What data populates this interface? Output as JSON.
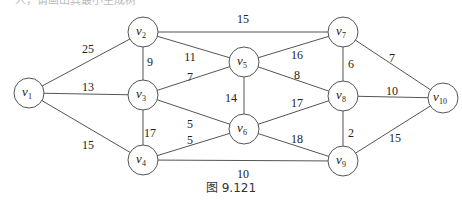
{
  "figure": {
    "caption": "图 9.121",
    "top_cut_text": "一人，请画出其最小生成树"
  },
  "graph": {
    "nodes": [
      {
        "id": "v1",
        "label": "v",
        "sub": "1",
        "x": 29,
        "y": 93
      },
      {
        "id": "v2",
        "label": "v",
        "sub": "2",
        "x": 143,
        "y": 32
      },
      {
        "id": "v3",
        "label": "v",
        "sub": "3",
        "x": 143,
        "y": 95
      },
      {
        "id": "v4",
        "label": "v",
        "sub": "4",
        "x": 143,
        "y": 160
      },
      {
        "id": "v5",
        "label": "v",
        "sub": "5",
        "x": 244,
        "y": 62
      },
      {
        "id": "v6",
        "label": "v",
        "sub": "6",
        "x": 244,
        "y": 129
      },
      {
        "id": "v7",
        "label": "v",
        "sub": "7",
        "x": 343,
        "y": 32
      },
      {
        "id": "v8",
        "label": "v",
        "sub": "8",
        "x": 343,
        "y": 96
      },
      {
        "id": "v9",
        "label": "v",
        "sub": "9",
        "x": 343,
        "y": 161
      },
      {
        "id": "v10",
        "label": "v",
        "sub": "10",
        "x": 443,
        "y": 98
      }
    ],
    "edges": [
      {
        "from": "v1",
        "to": "v2",
        "weight": "25",
        "lx": 88,
        "ly": 50
      },
      {
        "from": "v1",
        "to": "v3",
        "weight": "13",
        "lx": 88,
        "ly": 88
      },
      {
        "from": "v1",
        "to": "v4",
        "weight": "15",
        "lx": 88,
        "ly": 146
      },
      {
        "from": "v2",
        "to": "v3",
        "weight": "9",
        "lx": 150,
        "ly": 63
      },
      {
        "from": "v2",
        "to": "v5",
        "weight": "11",
        "lx": 190,
        "ly": 58
      },
      {
        "from": "v2",
        "to": "v7",
        "weight": "15",
        "lx": 243,
        "ly": 20
      },
      {
        "from": "v3",
        "to": "v5",
        "weight": "7",
        "lx": 190,
        "ly": 78
      },
      {
        "from": "v3",
        "to": "v4",
        "weight": "17",
        "lx": 150,
        "ly": 134
      },
      {
        "from": "v3",
        "to": "v6",
        "weight": "5",
        "lx": 190,
        "ly": 125
      },
      {
        "from": "v4",
        "to": "v6",
        "weight": "5",
        "lx": 190,
        "ly": 141
      },
      {
        "from": "v4",
        "to": "v9",
        "weight": "10",
        "lx": 243,
        "ly": 175
      },
      {
        "from": "v5",
        "to": "v6",
        "weight": "14",
        "lx": 231,
        "ly": 99
      },
      {
        "from": "v5",
        "to": "v7",
        "weight": "16",
        "lx": 297,
        "ly": 56
      },
      {
        "from": "v5",
        "to": "v8",
        "weight": "8",
        "lx": 297,
        "ly": 76
      },
      {
        "from": "v6",
        "to": "v8",
        "weight": "17",
        "lx": 297,
        "ly": 104
      },
      {
        "from": "v6",
        "to": "v9",
        "weight": "18",
        "lx": 297,
        "ly": 140
      },
      {
        "from": "v7",
        "to": "v8",
        "weight": "6",
        "lx": 351,
        "ly": 65
      },
      {
        "from": "v7",
        "to": "v10",
        "weight": "7",
        "lx": 392,
        "ly": 59
      },
      {
        "from": "v8",
        "to": "v10",
        "weight": "10",
        "lx": 392,
        "ly": 92
      },
      {
        "from": "v8",
        "to": "v9",
        "weight": "2",
        "lx": 351,
        "ly": 134
      },
      {
        "from": "v9",
        "to": "v10",
        "weight": "15",
        "lx": 395,
        "ly": 139
      }
    ]
  },
  "style": {
    "node_radius": 15,
    "line_color": "#555555",
    "text_color": "#222222"
  }
}
